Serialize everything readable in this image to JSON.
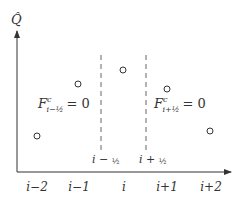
{
  "diagram": {
    "axis": {
      "y_label": "Q̂",
      "x_ticks": [
        {
          "label": "i−2",
          "x": 37
        },
        {
          "label": "i−1",
          "x": 79
        },
        {
          "label": "i",
          "x": 124
        },
        {
          "label": "i+1",
          "x": 167
        },
        {
          "label": "i+2",
          "x": 211
        }
      ]
    },
    "interfaces": [
      {
        "label_base": "i − ",
        "label_frac": "½",
        "x": 101
      },
      {
        "label_base": "i + ",
        "label_frac": "½",
        "x": 146
      }
    ],
    "flux_labels": [
      {
        "F": "F",
        "sup": "c",
        "sub": "i−½",
        "eq": "= 0"
      },
      {
        "F": "F",
        "sup": "c",
        "sub": "i+½",
        "eq": "= 0"
      }
    ],
    "points": [
      {
        "cell": "i−2",
        "x": 37,
        "y": 136
      },
      {
        "cell": "i−1",
        "x": 78,
        "y": 84
      },
      {
        "cell": "i",
        "x": 123,
        "y": 70
      },
      {
        "cell": "i+1",
        "x": 167,
        "y": 89
      },
      {
        "cell": "i+2",
        "x": 210,
        "y": 131
      }
    ],
    "colors": {
      "stroke": "#333333",
      "dashed": "#666666",
      "background": "#ffffff"
    }
  }
}
